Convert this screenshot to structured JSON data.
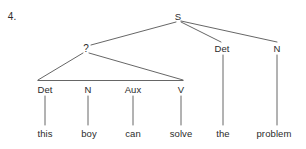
{
  "exercise": {
    "number": "4."
  },
  "colors": {
    "ink": "#2b2b2b",
    "line": "#555555",
    "background": "#ffffff"
  },
  "tree": {
    "root": {
      "label": "S",
      "x": 178,
      "y": 16
    },
    "nodes": [
      {
        "id": "unknown-phrase",
        "label": "?",
        "x": 86,
        "y": 48
      },
      {
        "id": "det-left",
        "label": "Det",
        "x": 45,
        "y": 89
      },
      {
        "id": "n-left",
        "label": "N",
        "x": 88,
        "y": 89
      },
      {
        "id": "aux",
        "label": "Aux",
        "x": 133,
        "y": 89
      },
      {
        "id": "v",
        "label": "V",
        "x": 181,
        "y": 89
      },
      {
        "id": "det-right",
        "label": "Det",
        "x": 222,
        "y": 48
      },
      {
        "id": "n-right",
        "label": "N",
        "x": 277,
        "y": 48
      }
    ],
    "words": [
      {
        "id": "word-this",
        "label": "this",
        "x": 45,
        "y": 133
      },
      {
        "id": "word-boy",
        "label": "boy",
        "x": 89,
        "y": 133
      },
      {
        "id": "word-can",
        "label": "can",
        "x": 133,
        "y": 133
      },
      {
        "id": "word-solve",
        "label": "solve",
        "x": 181,
        "y": 133
      },
      {
        "id": "word-the",
        "label": "the",
        "x": 223,
        "y": 133
      },
      {
        "id": "word-problem",
        "label": "problem",
        "x": 274,
        "y": 133
      }
    ],
    "sentence": "this boy can solve the problem"
  }
}
